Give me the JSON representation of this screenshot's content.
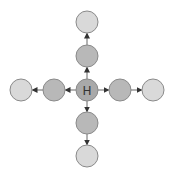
{
  "diagram": {
    "center_label": "H",
    "colors": {
      "center_fill": "#a9a9a9",
      "inner_fill": "#b8b8b8",
      "outer_fill": "#d9d9d9",
      "stroke": "#8a8a8a",
      "arrow": "#333333"
    },
    "nodes": [
      {
        "id": "center",
        "x": 87,
        "y": 90,
        "ring": "center"
      },
      {
        "id": "up-inner",
        "x": 87,
        "y": 56,
        "ring": "inner"
      },
      {
        "id": "up-outer",
        "x": 87,
        "y": 22,
        "ring": "outer"
      },
      {
        "id": "down-inner",
        "x": 87,
        "y": 123,
        "ring": "inner"
      },
      {
        "id": "down-outer",
        "x": 87,
        "y": 156,
        "ring": "outer"
      },
      {
        "id": "left-inner",
        "x": 54,
        "y": 90,
        "ring": "inner"
      },
      {
        "id": "left-outer",
        "x": 21,
        "y": 90,
        "ring": "outer"
      },
      {
        "id": "right-inner",
        "x": 120,
        "y": 90,
        "ring": "inner"
      },
      {
        "id": "right-outer",
        "x": 153,
        "y": 90,
        "ring": "outer"
      }
    ],
    "edges": [
      {
        "from": "center",
        "to": "up-inner"
      },
      {
        "from": "up-inner",
        "to": "up-outer"
      },
      {
        "from": "center",
        "to": "down-inner"
      },
      {
        "from": "down-inner",
        "to": "down-outer"
      },
      {
        "from": "center",
        "to": "left-inner"
      },
      {
        "from": "left-inner",
        "to": "left-outer"
      },
      {
        "from": "center",
        "to": "right-inner"
      },
      {
        "from": "right-inner",
        "to": "right-outer"
      }
    ]
  }
}
